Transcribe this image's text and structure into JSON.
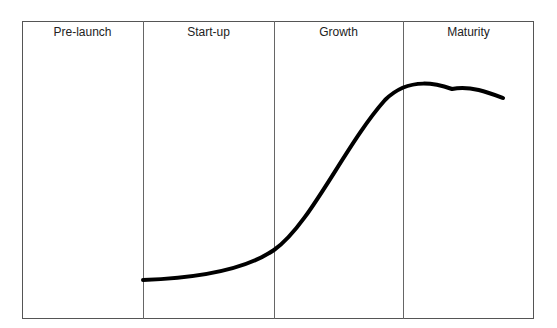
{
  "diagram": {
    "type": "lifecycle-s-curve",
    "stages": [
      {
        "label": "Pre-launch"
      },
      {
        "label": "Start-up"
      },
      {
        "label": "Growth"
      },
      {
        "label": "Maturity"
      }
    ],
    "curve_color": "#000000",
    "border_color": "#555555"
  }
}
